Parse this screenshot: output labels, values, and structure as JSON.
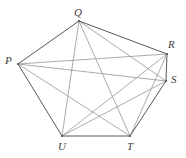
{
  "figure": {
    "type": "graph-diagram",
    "background_color": "#ffffff",
    "perimeter_edge_color": "#585858",
    "diagonal_edge_color": "#969696",
    "label_color": "#3c3c3c"
  },
  "graph_data": {
    "type": "graph",
    "vertex_count": 6,
    "edge_count": 15,
    "vertices": [
      {
        "id": "P",
        "label": "P",
        "x": 18,
        "y": 64,
        "label_x": 5,
        "label_y": 55
      },
      {
        "id": "Q",
        "label": "Q",
        "x": 79,
        "y": 21,
        "label_x": 74,
        "label_y": 7
      },
      {
        "id": "R",
        "label": "R",
        "x": 167,
        "y": 54,
        "label_x": 168,
        "label_y": 39
      },
      {
        "id": "S",
        "label": "S",
        "x": 166,
        "y": 81,
        "label_x": 171,
        "label_y": 74
      },
      {
        "id": "T",
        "label": "T",
        "x": 130,
        "y": 136,
        "label_x": 127,
        "label_y": 141
      },
      {
        "id": "U",
        "label": "U",
        "x": 62,
        "y": 136,
        "label_x": 58,
        "label_y": 141
      }
    ],
    "perimeter_edges": [
      {
        "from": "P",
        "to": "Q"
      },
      {
        "from": "Q",
        "to": "R"
      },
      {
        "from": "R",
        "to": "S"
      },
      {
        "from": "S",
        "to": "T"
      },
      {
        "from": "T",
        "to": "U"
      },
      {
        "from": "U",
        "to": "P"
      }
    ],
    "diagonal_edges": [
      {
        "from": "P",
        "to": "R"
      },
      {
        "from": "P",
        "to": "S"
      },
      {
        "from": "P",
        "to": "T"
      },
      {
        "from": "Q",
        "to": "S"
      },
      {
        "from": "Q",
        "to": "T"
      },
      {
        "from": "Q",
        "to": "U"
      },
      {
        "from": "R",
        "to": "T"
      },
      {
        "from": "R",
        "to": "U"
      },
      {
        "from": "S",
        "to": "U"
      }
    ]
  }
}
